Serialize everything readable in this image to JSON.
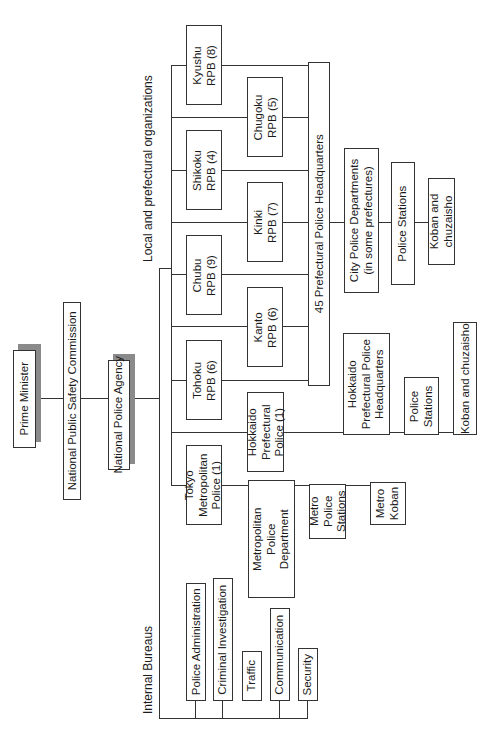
{
  "top": {
    "prime_minister": "Prime Minister",
    "npsc": "National Public Safety Commission",
    "npa": "National Police Agency"
  },
  "sections": {
    "local": "Local and prefectural organizations",
    "internal": "Internal Bureaus"
  },
  "rpb": {
    "kyushu": [
      "Kyushu",
      "RPB (8)"
    ],
    "chugoku": [
      "Chugoku",
      "RPB (5)"
    ],
    "shikoku": [
      "Shikoku",
      "RPB (4)"
    ],
    "kinki": [
      "Kinki",
      "RPB (7)"
    ],
    "chubu": [
      "Chubu",
      "RPB (9)"
    ],
    "kanto": [
      "Kanto",
      "RPB (6)"
    ],
    "tohoku": [
      "Tohoku",
      "RPB (6)"
    ]
  },
  "prefectural": {
    "pph45": "45 Prefectural Police Headquarters",
    "city_depts": [
      "City Police Departments",
      "(in some prefectures)"
    ],
    "city_stations": "Police Stations",
    "city_koban": [
      "Koban and",
      "chuzaisho"
    ]
  },
  "hokkaido": {
    "police": [
      "Hokkaido",
      "Prefectural",
      "Police (1)"
    ],
    "hq": [
      "Hokkaido",
      "Prefectural Police",
      "Headquarters"
    ],
    "stations": [
      "Police",
      "Stations"
    ],
    "koban": "Koban and chuzaisho"
  },
  "tokyo": {
    "police": [
      "Tokyo",
      "Metropolitan",
      "Police (1)"
    ],
    "mpd": [
      "Metropolitan",
      "Police",
      "Department"
    ],
    "stations": [
      "Metro",
      "Police",
      "Stations"
    ],
    "koban": [
      "Metro",
      "Koban"
    ]
  },
  "bureaus": [
    "Police Administration",
    "Criminal Investigation",
    "Traffic",
    "Communication",
    "Security"
  ]
}
